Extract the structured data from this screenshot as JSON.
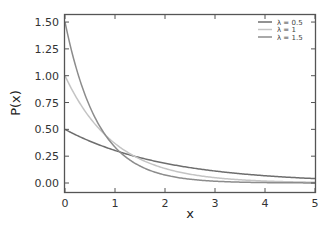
{
  "chart_data": {
    "type": "line",
    "title": "",
    "xlabel": "x",
    "ylabel": "P(x)",
    "xlim": [
      0,
      5
    ],
    "ylim": [
      -0.05,
      1.55
    ],
    "xticks": [
      "0",
      "1",
      "2",
      "3",
      "4",
      "5"
    ],
    "yticks": [
      "0.00",
      "0.25",
      "0.50",
      "0.75",
      "1.00",
      "1.25",
      "1.50"
    ],
    "grid": false,
    "legend_position": "upper right",
    "function": "P(x) = λ·e^(−λx)",
    "series": [
      {
        "name": "λ = 0.5",
        "lambda": 0.5,
        "color": "#6e6e6e",
        "x": [
          0,
          1,
          2,
          3,
          4,
          5
        ],
        "values": [
          0.5,
          0.303,
          0.184,
          0.112,
          0.068,
          0.041
        ]
      },
      {
        "name": "λ = 1",
        "lambda": 1.0,
        "color": "#c4c4c4",
        "x": [
          0,
          1,
          2,
          3,
          4,
          5
        ],
        "values": [
          1.0,
          0.368,
          0.135,
          0.05,
          0.018,
          0.007
        ]
      },
      {
        "name": "λ = 1.5",
        "lambda": 1.5,
        "color": "#8c8c8c",
        "x": [
          0,
          1,
          2,
          3,
          4,
          5
        ],
        "values": [
          1.5,
          0.335,
          0.075,
          0.017,
          0.004,
          0.001
        ]
      }
    ]
  }
}
